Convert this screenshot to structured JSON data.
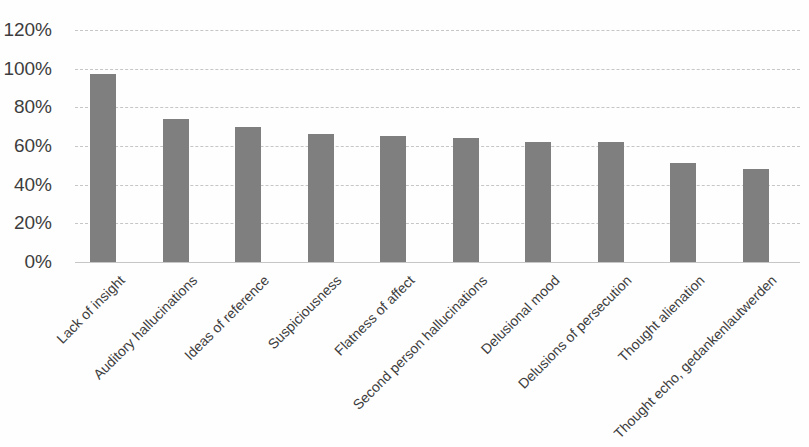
{
  "chart_data": {
    "type": "bar",
    "title": "",
    "xlabel": "",
    "ylabel": "",
    "categories": [
      "Lack of insight",
      "Auditory hallucinations",
      "Ideas of reference",
      "Suspiciousness",
      "Flatness of affect",
      "Second person hallucinations",
      "Delusional mood",
      "Delusions of persecution",
      "Thought alienation",
      "Thought echo, gedankenlautwerden"
    ],
    "values": [
      97,
      74,
      70,
      66,
      65,
      64,
      62,
      62,
      51,
      48
    ],
    "value_unit": "%",
    "ylim": [
      0,
      120
    ],
    "y_tick_step": 20,
    "y_tick_labels": [
      "0%",
      "20%",
      "40%",
      "60%",
      "80%",
      "100%",
      "120%"
    ],
    "grid": true,
    "legend": false,
    "bar_color": "#7f7f7f",
    "axis_text_color": "#3d3d3d",
    "gridline_color": "#c6c6c6"
  }
}
